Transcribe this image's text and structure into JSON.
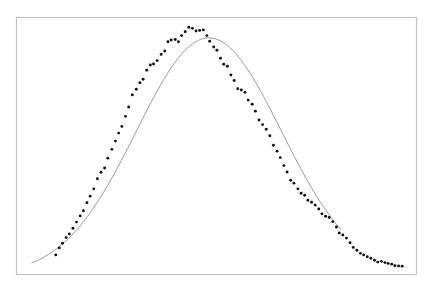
{
  "chart_data": {
    "type": "scatter",
    "title": "",
    "xlabel": "",
    "ylabel": "",
    "xlim": [
      0,
      100
    ],
    "ylim": [
      0,
      1
    ],
    "grid": false,
    "legend": "none",
    "axes_visible": false,
    "frame": true,
    "colors": {
      "points": "#111111",
      "line": "#8c8c8c",
      "frame": "#c4c4c4"
    },
    "series": [
      {
        "name": "observed",
        "kind": "scatter",
        "points": [
          [
            9.9,
            0.078
          ],
          [
            10.8,
            0.105
          ],
          [
            11.6,
            0.123
          ],
          [
            12.5,
            0.145
          ],
          [
            13.3,
            0.159
          ],
          [
            14.2,
            0.181
          ],
          [
            15.1,
            0.205
          ],
          [
            16.0,
            0.229
          ],
          [
            16.8,
            0.249
          ],
          [
            17.7,
            0.28
          ],
          [
            18.5,
            0.305
          ],
          [
            19.4,
            0.334
          ],
          [
            20.3,
            0.373
          ],
          [
            21.2,
            0.398
          ],
          [
            22.1,
            0.415
          ],
          [
            22.9,
            0.453
          ],
          [
            23.9,
            0.487
          ],
          [
            24.8,
            0.519
          ],
          [
            25.6,
            0.55
          ],
          [
            26.4,
            0.576
          ],
          [
            27.3,
            0.615
          ],
          [
            28.1,
            0.651
          ],
          [
            29.0,
            0.698
          ],
          [
            30.0,
            0.72
          ],
          [
            30.9,
            0.745
          ],
          [
            31.7,
            0.759
          ],
          [
            32.6,
            0.794
          ],
          [
            33.5,
            0.814
          ],
          [
            34.3,
            0.818
          ],
          [
            35.2,
            0.831
          ],
          [
            36.2,
            0.855
          ],
          [
            37.1,
            0.868
          ],
          [
            37.9,
            0.904
          ],
          [
            38.7,
            0.911
          ],
          [
            39.7,
            0.913
          ],
          [
            40.5,
            0.904
          ],
          [
            41.3,
            0.928
          ],
          [
            42.2,
            0.943
          ],
          [
            43.1,
            0.96
          ],
          [
            44.0,
            0.956
          ],
          [
            44.9,
            0.946
          ],
          [
            45.8,
            0.948
          ],
          [
            46.7,
            0.95
          ],
          [
            47.6,
            0.928
          ],
          [
            48.3,
            0.906
          ],
          [
            49.3,
            0.884
          ],
          [
            50.1,
            0.871
          ],
          [
            51.0,
            0.84
          ],
          [
            51.8,
            0.817
          ],
          [
            52.7,
            0.809
          ],
          [
            53.6,
            0.775
          ],
          [
            54.4,
            0.754
          ],
          [
            55.3,
            0.722
          ],
          [
            56.2,
            0.717
          ],
          [
            57.1,
            0.708
          ],
          [
            57.9,
            0.678
          ],
          [
            58.9,
            0.662
          ],
          [
            59.7,
            0.635
          ],
          [
            60.6,
            0.601
          ],
          [
            61.5,
            0.583
          ],
          [
            62.4,
            0.565
          ],
          [
            63.3,
            0.54
          ],
          [
            64.2,
            0.503
          ],
          [
            65.1,
            0.48
          ],
          [
            65.9,
            0.455
          ],
          [
            66.8,
            0.424
          ],
          [
            67.6,
            0.399
          ],
          [
            68.5,
            0.367
          ],
          [
            69.3,
            0.356
          ],
          [
            70.3,
            0.334
          ],
          [
            71.1,
            0.317
          ],
          [
            72.0,
            0.309
          ],
          [
            72.8,
            0.29
          ],
          [
            73.7,
            0.282
          ],
          [
            74.6,
            0.271
          ],
          [
            75.5,
            0.256
          ],
          [
            76.3,
            0.237
          ],
          [
            77.2,
            0.228
          ],
          [
            78.1,
            0.223
          ],
          [
            79.0,
            0.207
          ],
          [
            79.9,
            0.186
          ],
          [
            80.6,
            0.163
          ],
          [
            81.5,
            0.155
          ],
          [
            82.4,
            0.143
          ],
          [
            83.3,
            0.125
          ],
          [
            84.1,
            0.107
          ],
          [
            85.0,
            0.096
          ],
          [
            85.9,
            0.084
          ],
          [
            86.7,
            0.078
          ],
          [
            87.6,
            0.071
          ],
          [
            88.5,
            0.065
          ],
          [
            89.4,
            0.057
          ],
          [
            90.2,
            0.05
          ],
          [
            91.1,
            0.053
          ],
          [
            92.0,
            0.048
          ],
          [
            92.8,
            0.045
          ],
          [
            93.7,
            0.042
          ],
          [
            94.5,
            0.036
          ],
          [
            95.4,
            0.035
          ],
          [
            96.3,
            0.034
          ]
        ]
      },
      {
        "name": "gaussian fit",
        "kind": "line",
        "model": "gaussian",
        "params": {
          "amplitude": 0.919,
          "mean": 48.1,
          "sigma": 18.1,
          "baseline": 0.0
        },
        "x_range": [
          3.9,
          81.0
        ]
      }
    ]
  }
}
